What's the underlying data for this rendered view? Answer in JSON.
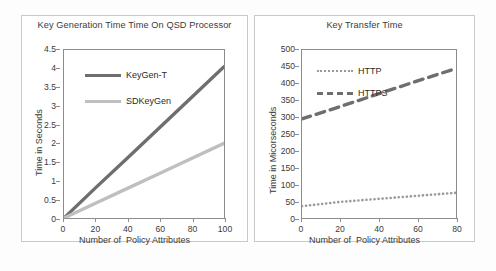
{
  "figure": {
    "panels": [
      {
        "id": "left",
        "chart_data": {
          "type": "line",
          "title": "Key Generation Time Time  On QSD Processor",
          "xlabel": "Number of  Policy Attributes",
          "ylabel": "Time in Seconds",
          "xlim": [
            0,
            100
          ],
          "ylim": [
            0,
            4.5
          ],
          "xticks": [
            0,
            20,
            40,
            60,
            80,
            100
          ],
          "yticks": [
            0,
            0.5,
            1,
            1.5,
            2,
            2.5,
            3,
            3.5,
            4,
            4.5
          ],
          "xticklabels": [
            "0",
            "20",
            "40",
            "60",
            "80",
            "100"
          ],
          "yticklabels": [
            "0",
            "0.5",
            "1",
            "1.5",
            "2",
            "2.5",
            "3",
            "3.5",
            "4",
            "4.5"
          ],
          "grid": false,
          "legend_position": "upper-left-inside",
          "series": [
            {
              "name": "KeyGen-T",
              "color": "#6e6e6e",
              "style": "solid",
              "x": [
                0,
                20,
                40,
                60,
                80,
                100
              ],
              "values": [
                0,
                0.82,
                1.62,
                2.43,
                3.24,
                4.05
              ]
            },
            {
              "name": "SDKeyGen",
              "color": "#bfbfbf",
              "style": "solid",
              "x": [
                0,
                20,
                40,
                60,
                80,
                100
              ],
              "values": [
                0,
                0.4,
                0.8,
                1.2,
                1.6,
                2.0
              ]
            }
          ]
        }
      },
      {
        "id": "right",
        "chart_data": {
          "type": "line",
          "title": "Key Transfer Time",
          "xlabel": "Number of  Policy Attributes",
          "ylabel": "Time in Micorseconds",
          "xlim": [
            0,
            80
          ],
          "ylim": [
            0,
            500
          ],
          "xticks": [
            0,
            20,
            40,
            60,
            80
          ],
          "yticks": [
            0,
            50,
            100,
            150,
            200,
            250,
            300,
            350,
            400,
            450,
            500
          ],
          "xticklabels": [
            "0",
            "20",
            "40",
            "60",
            "80"
          ],
          "yticklabels": [
            "0",
            "50",
            "100",
            "150",
            "200",
            "250",
            "300",
            "350",
            "400",
            "450",
            "500"
          ],
          "grid": false,
          "legend_position": "upper-left-inside",
          "series": [
            {
              "name": "HTTP",
              "color": "#9a9a9a",
              "style": "dotted",
              "x": [
                0,
                20,
                40,
                60,
                80
              ],
              "values": [
                35,
                48,
                57,
                66,
                75
              ]
            },
            {
              "name": "HTTPS",
              "color": "#6e6e6e",
              "style": "dashed",
              "x": [
                0,
                20,
                40,
                60,
                80
              ],
              "values": [
                295,
                332,
                370,
                408,
                445
              ]
            }
          ]
        }
      }
    ]
  }
}
